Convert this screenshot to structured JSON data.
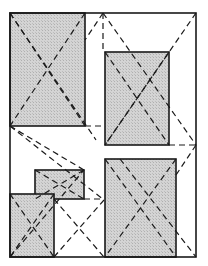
{
  "diagram": {
    "width": 208,
    "height": 266,
    "colors": {
      "background": "#ffffff",
      "stroke": "#1a1a1a",
      "box_fill": "#d4d4d4",
      "hatch": "#b0b0b0"
    },
    "frame": {
      "x": 10,
      "y": 13,
      "w": 186,
      "h": 244
    },
    "boxes": [
      {
        "name": "box-top-left",
        "x": 10,
        "y": 13,
        "w": 75,
        "h": 113
      },
      {
        "name": "box-right-middle",
        "x": 105,
        "y": 52,
        "w": 64,
        "h": 93
      },
      {
        "name": "box-small-middle",
        "x": 35,
        "y": 170,
        "w": 49,
        "h": 29
      },
      {
        "name": "box-bottom-left",
        "x": 10,
        "y": 194,
        "w": 44,
        "h": 63
      },
      {
        "name": "box-bottom-right",
        "x": 105,
        "y": 159,
        "w": 71,
        "h": 98
      }
    ],
    "dashed_lines": [
      [
        10,
        13,
        85,
        126
      ],
      [
        85,
        13,
        10,
        126
      ],
      [
        10,
        13,
        96,
        140
      ],
      [
        103,
        13,
        103,
        52
      ],
      [
        103,
        13,
        85,
        40
      ],
      [
        103,
        13,
        196,
        145
      ],
      [
        196,
        13,
        105,
        145
      ],
      [
        105,
        52,
        169,
        145
      ],
      [
        169,
        52,
        105,
        145
      ],
      [
        85,
        126,
        104,
        126
      ],
      [
        10,
        126,
        84,
        170
      ],
      [
        10,
        126,
        104,
        200
      ],
      [
        169,
        145,
        196,
        145
      ],
      [
        196,
        145,
        176,
        175
      ],
      [
        35,
        170,
        84,
        199
      ],
      [
        84,
        170,
        35,
        199
      ],
      [
        84,
        199,
        104,
        199
      ],
      [
        10,
        194,
        54,
        257
      ],
      [
        54,
        194,
        10,
        257
      ],
      [
        54,
        257,
        104,
        200
      ],
      [
        54,
        199,
        104,
        257
      ],
      [
        105,
        159,
        176,
        257
      ],
      [
        176,
        159,
        105,
        257
      ],
      [
        120,
        159,
        196,
        257
      ],
      [
        10,
        257,
        84,
        170
      ]
    ]
  }
}
